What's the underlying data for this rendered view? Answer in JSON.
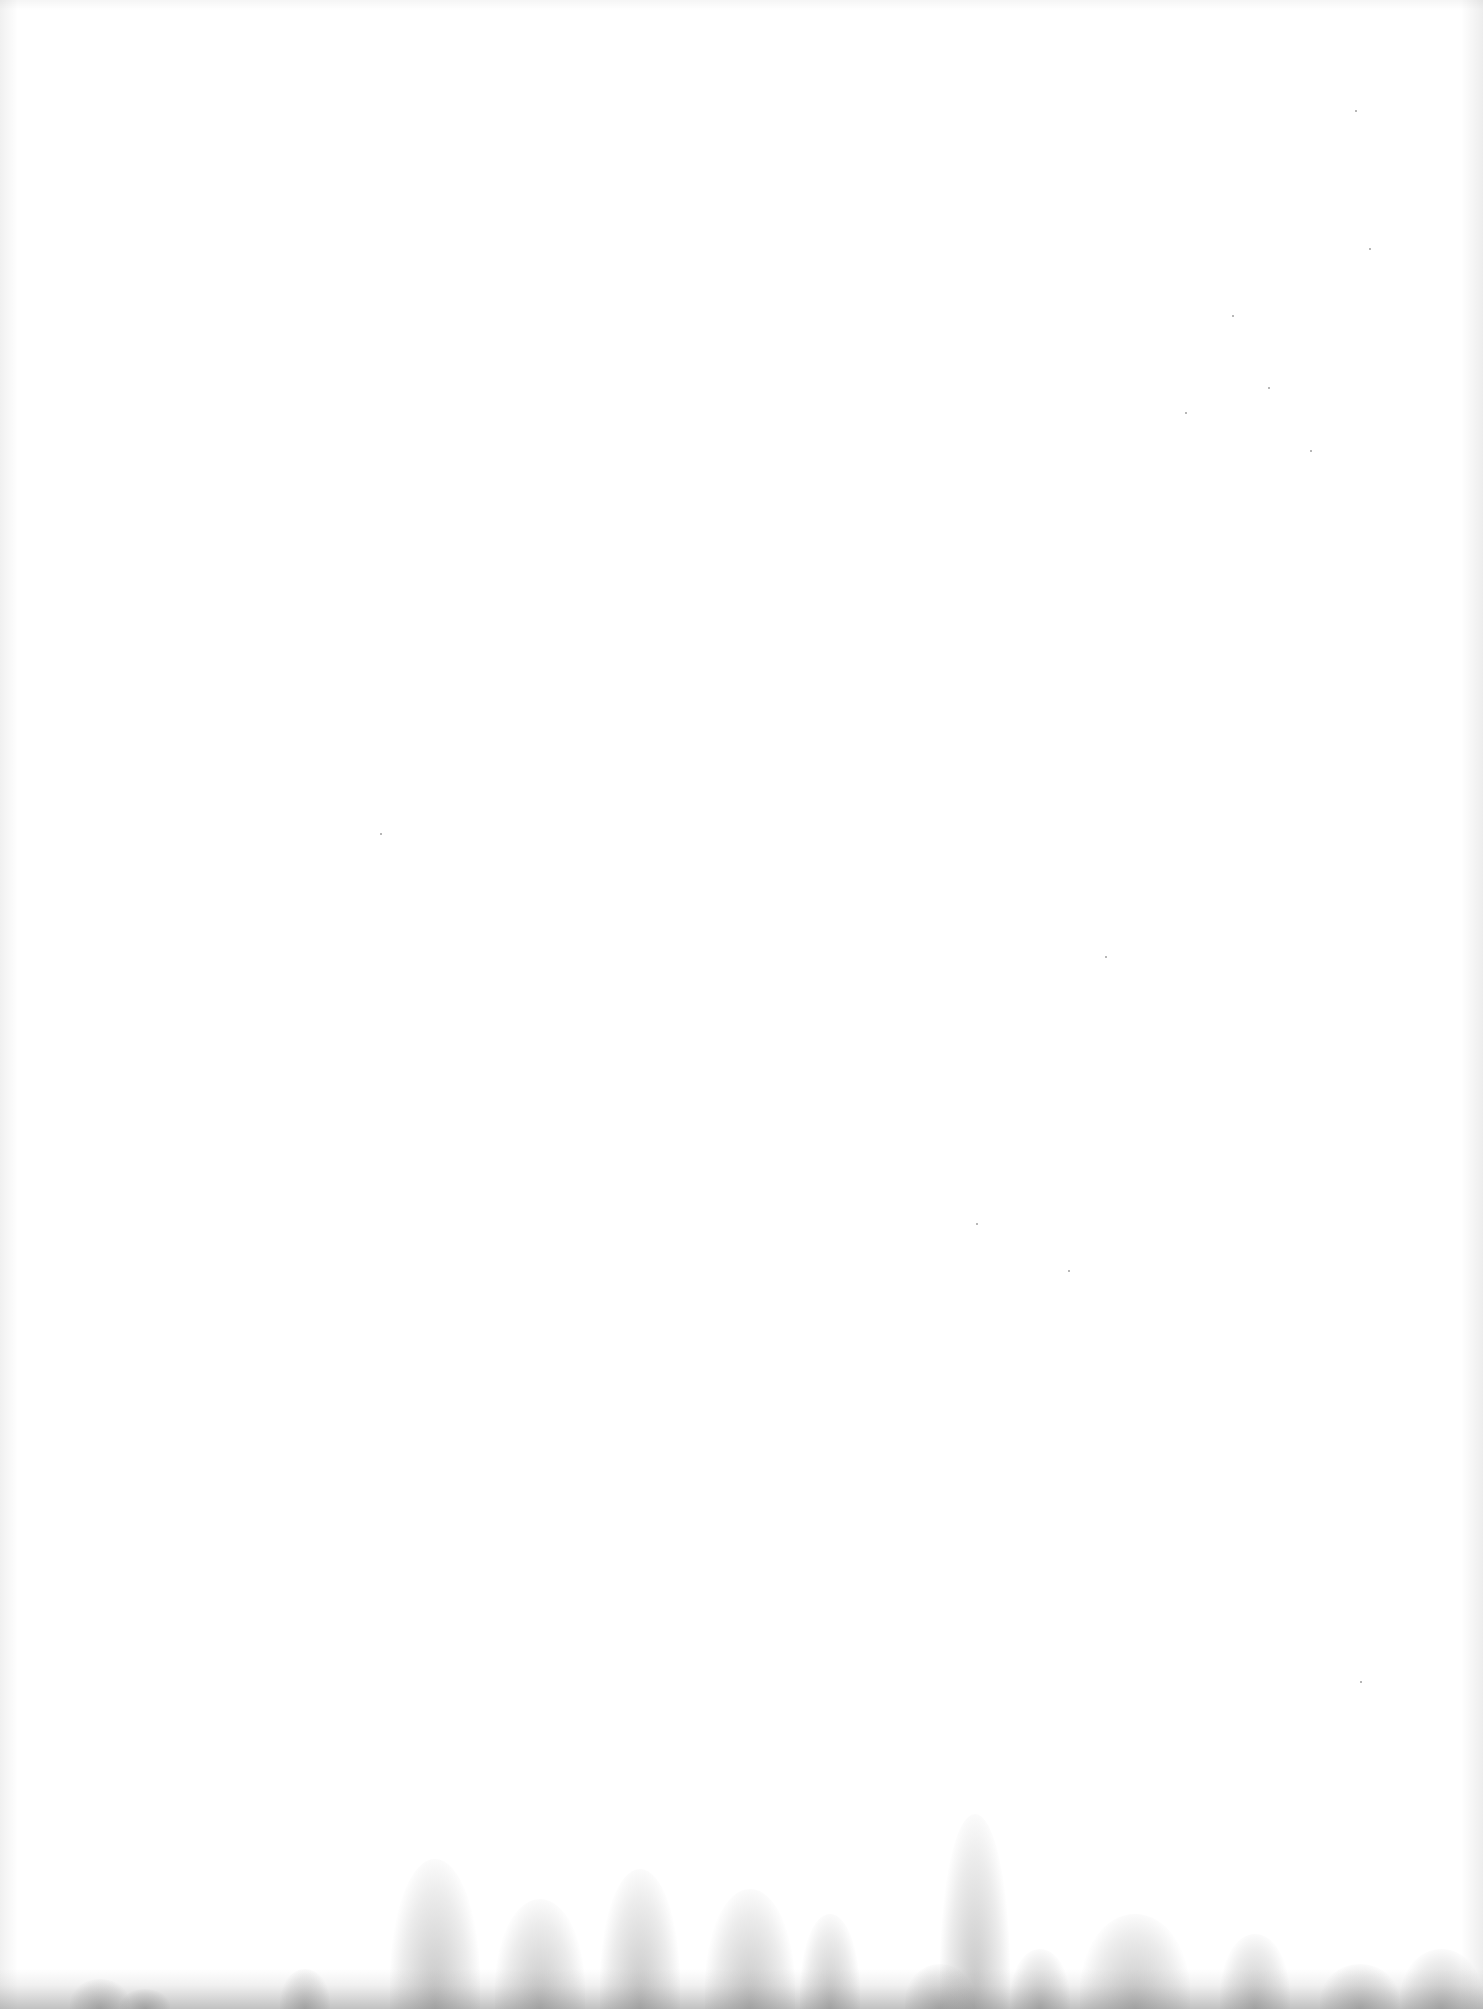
{
  "document": {
    "type": "blank-scanned-page",
    "text_content": [],
    "background_color": "#ffffff",
    "stain_color": "#8a8a8a"
  }
}
